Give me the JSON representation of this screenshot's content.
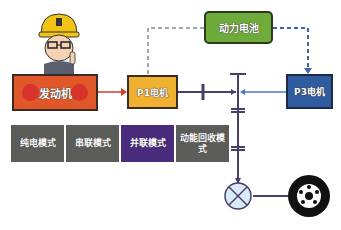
{
  "diagram": {
    "components": {
      "engine": {
        "label": "发动机",
        "color": "#e0582a"
      },
      "p1_motor": {
        "label": "P1电机",
        "color": "#f0b030"
      },
      "battery": {
        "label": "动力电池",
        "color": "#6fab3a"
      },
      "p3_motor": {
        "label": "P3电机",
        "color": "#2f5c9e"
      },
      "differential": {
        "label": "",
        "color": "#d8ecf8"
      },
      "wheel": {
        "label": ""
      }
    },
    "modes": [
      {
        "label": "纯电模式",
        "active": false
      },
      {
        "label": "串联模式",
        "active": false
      },
      {
        "label": "并联模式",
        "active": true
      },
      {
        "label": "动能回收模式",
        "active": false
      }
    ],
    "colors": {
      "mode_inactive": "#5c5c58",
      "mode_active": "#4a2a7a",
      "shaft": "#4a3f6b",
      "engine_arrow": "#d83a2a",
      "p3_arrow": "#4a7ac8",
      "dashed_line": "#8c8c8c",
      "battery_to_p3": "#3d63a8"
    }
  }
}
